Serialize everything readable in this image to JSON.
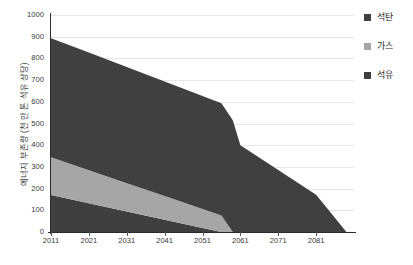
{
  "chart_data": {
    "type": "area",
    "title": "",
    "xlabel": "",
    "ylabel": "에너지 부존량 (천 만 톤 석유 상당)",
    "stacked": true,
    "xlim": [
      2011,
      2091
    ],
    "ylim": [
      0,
      1000
    ],
    "grid": true,
    "legend_position": "right",
    "x_ticks": [
      "2011",
      "2021",
      "2031",
      "2041",
      "2051",
      "2061",
      "2071",
      "2081"
    ],
    "x_tick_values": [
      2011,
      2021,
      2031,
      2041,
      2051,
      2061,
      2071,
      2081
    ],
    "y_ticks": [
      "0",
      "100",
      "200",
      "300",
      "400",
      "500",
      "600",
      "700",
      "800",
      "900",
      "1000"
    ],
    "y_tick_values": [
      0,
      100,
      200,
      300,
      400,
      500,
      600,
      700,
      800,
      900,
      1000
    ],
    "x": [
      2011,
      2021,
      2031,
      2041,
      2051,
      2056,
      2059,
      2061,
      2071,
      2081,
      2089
    ],
    "series": [
      {
        "name": "석유",
        "color": "#3f3f3f",
        "stack_order": 1,
        "values": [
          170,
          132,
          94,
          57,
          19,
          0,
          0,
          0,
          0,
          0,
          0
        ]
      },
      {
        "name": "가스",
        "color": "#a6a6a6",
        "stack_order": 2,
        "values": [
          175,
          153,
          131,
          109,
          87,
          76,
          0,
          0,
          0,
          0,
          0
        ]
      },
      {
        "name": "석탄",
        "color": "#404040",
        "stack_order": 3,
        "values": [
          548,
          542,
          535,
          528,
          521,
          517,
          515,
          400,
          286,
          172,
          0
        ]
      }
    ],
    "cumulative_top_2011": {
      "oil_top": 170,
      "gas_top": 345,
      "coal_top": 893
    }
  },
  "legend": {
    "items": [
      {
        "label": "석탄",
        "color": "#404040",
        "swatch_name": "legend-swatch-coal"
      },
      {
        "label": "가스",
        "color": "#a6a6a6",
        "swatch_name": "legend-swatch-gas"
      },
      {
        "label": "석유",
        "color": "#3f3f3f",
        "swatch_name": "legend-swatch-oil"
      }
    ]
  },
  "axes": {
    "y_title": "에너지 부존량 (천 만 톤 석유 상당)"
  },
  "colors": {
    "coal": "#404040",
    "gas": "#a6a6a6",
    "oil": "#3f3f3f",
    "grid": "#e6e6e6",
    "axis": "#2b2b2b",
    "text": "#3a3a3a",
    "background": "#ffffff"
  }
}
